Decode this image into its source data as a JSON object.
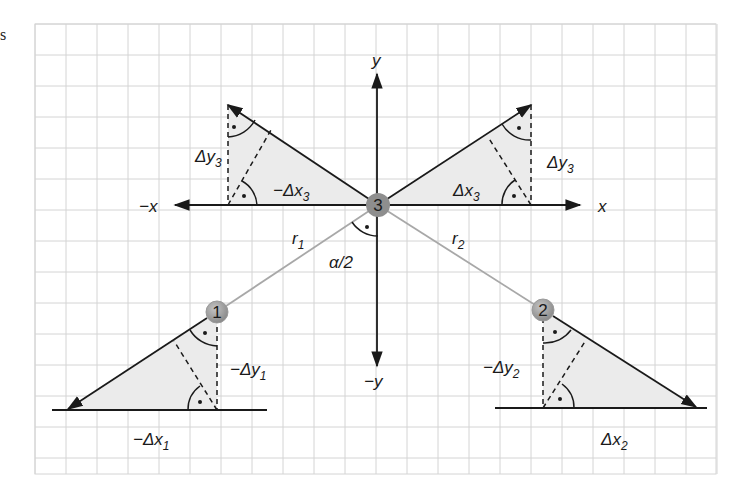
{
  "corner_text": "s",
  "grid": {
    "left": 35,
    "top": 24,
    "right": 716,
    "bottom": 474,
    "cell": 31,
    "color": "#d4d4d4"
  },
  "colors": {
    "triangle_fill": "#ebebeb",
    "line": "#1a1a1a",
    "radius_line": "#a8a8a8",
    "node_fill": "#8c8c8c",
    "node_highlight": "#b0b0b0"
  },
  "axes": {
    "x_pos_label": "x",
    "x_neg_label": "−x",
    "y_pos_label": "y",
    "y_neg_label": "−y"
  },
  "nodes": [
    {
      "id": "1",
      "label": "1",
      "x": 217,
      "y": 312
    },
    {
      "id": "2",
      "label": "2",
      "x": 543,
      "y": 310
    },
    {
      "id": "3",
      "label": "3",
      "x": 378,
      "y": 205
    }
  ],
  "labels": {
    "delta_y3_left": "Δy",
    "delta_y3_left_sub": "3",
    "neg_delta_x3": "−Δx",
    "neg_delta_x3_sub": "3",
    "delta_y3_right": "Δy",
    "delta_y3_right_sub": "3",
    "delta_x3": "Δx",
    "delta_x3_sub": "3",
    "r1": "r",
    "r1_sub": "1",
    "r2": "r",
    "r2_sub": "2",
    "alpha_half": "α/2",
    "neg_delta_y1": "−Δy",
    "neg_delta_y1_sub": "1",
    "neg_delta_x1": "−Δx",
    "neg_delta_x1_sub": "1",
    "neg_delta_y2": "−Δy",
    "neg_delta_y2_sub": "2",
    "delta_x2": "Δx",
    "delta_x2_sub": "2"
  }
}
